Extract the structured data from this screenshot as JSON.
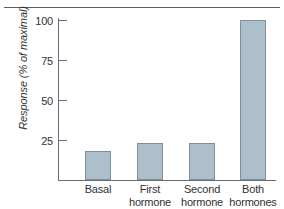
{
  "figure": {
    "has_top_rule": true,
    "background_color": "#ffffff"
  },
  "chart_data": {
    "type": "bar",
    "title": "",
    "xlabel": "",
    "ylabel": "Response (% of maximal)",
    "categories": [
      "Basal",
      "First hormone",
      "Second hormone",
      "Both hormones"
    ],
    "category_lines": [
      [
        "Basal",
        ""
      ],
      [
        "First",
        "hormone"
      ],
      [
        "Second",
        "hormone"
      ],
      [
        "Both",
        "hormones"
      ]
    ],
    "values": [
      18,
      23,
      23,
      100
    ],
    "ylim": [
      0,
      100
    ],
    "yticks": [
      25,
      50,
      75,
      100
    ],
    "ytick_labels": [
      "25",
      "50",
      "75",
      "100"
    ],
    "grid": false,
    "legend": false,
    "bar_fill_color": "#aebfcc",
    "bar_border_color": "#7e8f9d",
    "axis_color": "#6a6c6e"
  }
}
